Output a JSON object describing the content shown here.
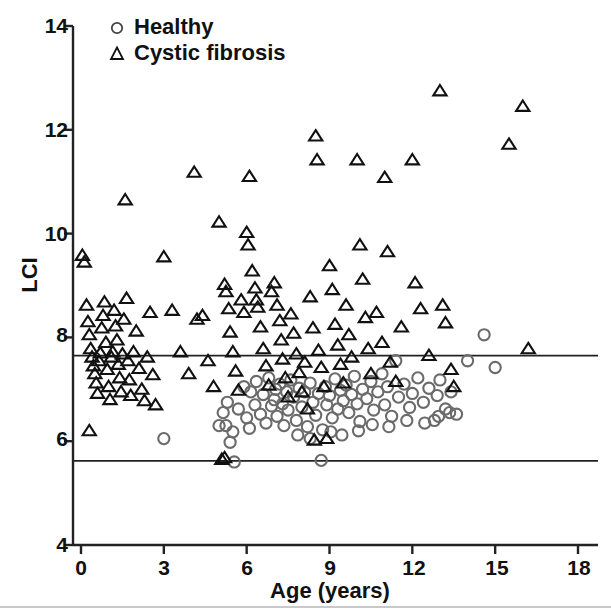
{
  "chart_data": {
    "type": "scatter",
    "title": "",
    "xlabel": "Age (years)",
    "ylabel": "LCI",
    "xlim": [
      -0.75,
      18.75
    ],
    "ylim": [
      4,
      14
    ],
    "xticks": [
      0,
      3,
      6,
      9,
      12,
      15,
      18
    ],
    "yticks": [
      4,
      6,
      8,
      10,
      12,
      14
    ],
    "grid": false,
    "legend_position": "top-left",
    "reference_lines": [
      {
        "name": "upper-limit-of-normal",
        "y": 7.65,
        "color": "#222222"
      },
      {
        "name": "lower-limit-of-normal",
        "y": 5.62,
        "color": "#222222"
      }
    ],
    "series": [
      {
        "name": "Healthy",
        "marker": "circle",
        "color": "#6b6b6b",
        "points": [
          [
            3.0,
            6.05
          ],
          [
            5.0,
            6.3
          ],
          [
            5.15,
            6.55
          ],
          [
            5.25,
            6.3
          ],
          [
            5.3,
            6.75
          ],
          [
            5.4,
            5.98
          ],
          [
            5.5,
            6.18
          ],
          [
            5.55,
            5.6
          ],
          [
            5.7,
            6.62
          ],
          [
            5.9,
            7.05
          ],
          [
            6.0,
            6.45
          ],
          [
            6.1,
            6.25
          ],
          [
            6.15,
            6.95
          ],
          [
            6.3,
            6.7
          ],
          [
            6.35,
            7.15
          ],
          [
            6.5,
            6.52
          ],
          [
            6.6,
            6.9
          ],
          [
            6.7,
            6.35
          ],
          [
            6.8,
            7.22
          ],
          [
            6.9,
            6.68
          ],
          [
            7.0,
            6.8
          ],
          [
            7.05,
            7.0
          ],
          [
            7.1,
            6.48
          ],
          [
            7.2,
            7.1
          ],
          [
            7.3,
            6.72
          ],
          [
            7.35,
            6.3
          ],
          [
            7.45,
            6.95
          ],
          [
            7.5,
            6.6
          ],
          [
            7.6,
            7.18
          ],
          [
            7.7,
            6.85
          ],
          [
            7.8,
            6.4
          ],
          [
            7.9,
            7.02
          ],
          [
            8.0,
            6.66
          ],
          [
            8.1,
            6.95
          ],
          [
            8.2,
            6.28
          ],
          [
            8.3,
            7.12
          ],
          [
            8.4,
            6.75
          ],
          [
            8.5,
            6.5
          ],
          [
            8.6,
            6.92
          ],
          [
            8.7,
            5.63
          ],
          [
            8.75,
            6.22
          ],
          [
            8.85,
            7.05
          ],
          [
            8.9,
            6.7
          ],
          [
            9.0,
            6.88
          ],
          [
            9.1,
            6.45
          ],
          [
            9.2,
            7.2
          ],
          [
            9.3,
            6.62
          ],
          [
            9.4,
            6.98
          ],
          [
            9.5,
            6.78
          ],
          [
            9.6,
            7.08
          ],
          [
            9.7,
            6.55
          ],
          [
            9.8,
            6.9
          ],
          [
            9.9,
            7.25
          ],
          [
            10.0,
            6.72
          ],
          [
            10.1,
            6.38
          ],
          [
            10.2,
            7.0
          ],
          [
            10.35,
            6.82
          ],
          [
            10.5,
            7.15
          ],
          [
            10.6,
            6.6
          ],
          [
            10.75,
            6.95
          ],
          [
            10.9,
            7.3
          ],
          [
            11.0,
            6.7
          ],
          [
            11.1,
            7.05
          ],
          [
            11.25,
            6.48
          ],
          [
            11.4,
            7.55
          ],
          [
            11.5,
            6.85
          ],
          [
            11.7,
            7.1
          ],
          [
            11.9,
            6.65
          ],
          [
            12.0,
            6.92
          ],
          [
            12.2,
            7.22
          ],
          [
            12.4,
            6.75
          ],
          [
            12.6,
            7.02
          ],
          [
            12.8,
            6.4
          ],
          [
            12.9,
            6.88
          ],
          [
            13.0,
            7.18
          ],
          [
            13.2,
            6.62
          ],
          [
            13.4,
            6.95
          ],
          [
            13.6,
            6.52
          ],
          [
            14.0,
            7.55
          ],
          [
            14.6,
            8.05
          ],
          [
            15.0,
            7.42
          ],
          [
            8.3,
            6.05
          ],
          [
            7.85,
            6.12
          ],
          [
            9.05,
            6.18
          ],
          [
            9.45,
            6.12
          ],
          [
            10.05,
            6.2
          ],
          [
            10.55,
            6.32
          ],
          [
            11.15,
            6.28
          ],
          [
            11.8,
            6.4
          ],
          [
            12.45,
            6.35
          ],
          [
            12.95,
            6.48
          ],
          [
            13.35,
            6.55
          ]
        ]
      },
      {
        "name": "Cystic fibrosis",
        "marker": "triangle",
        "color": "#111111",
        "points": [
          [
            0.05,
            9.58
          ],
          [
            0.12,
            9.45
          ],
          [
            0.2,
            8.62
          ],
          [
            0.25,
            8.3
          ],
          [
            0.3,
            8.05
          ],
          [
            0.35,
            7.78
          ],
          [
            0.4,
            7.62
          ],
          [
            0.45,
            7.45
          ],
          [
            0.5,
            7.3
          ],
          [
            0.55,
            7.12
          ],
          [
            0.6,
            6.92
          ],
          [
            0.65,
            7.55
          ],
          [
            0.7,
            7.7
          ],
          [
            0.75,
            8.18
          ],
          [
            0.8,
            8.42
          ],
          [
            0.85,
            8.68
          ],
          [
            0.9,
            7.9
          ],
          [
            0.95,
            7.38
          ],
          [
            1.0,
            7.05
          ],
          [
            1.05,
            6.8
          ],
          [
            1.1,
            7.62
          ],
          [
            1.15,
            7.72
          ],
          [
            1.2,
            8.52
          ],
          [
            1.25,
            8.22
          ],
          [
            1.3,
            7.95
          ],
          [
            1.35,
            7.48
          ],
          [
            1.4,
            7.22
          ],
          [
            1.45,
            6.95
          ],
          [
            1.5,
            7.68
          ],
          [
            1.55,
            8.35
          ],
          [
            1.6,
            10.65
          ],
          [
            1.65,
            8.75
          ],
          [
            1.7,
            7.55
          ],
          [
            1.75,
            7.18
          ],
          [
            1.8,
            6.88
          ],
          [
            1.9,
            7.72
          ],
          [
            2.0,
            8.12
          ],
          [
            2.1,
            7.4
          ],
          [
            2.2,
            7.0
          ],
          [
            2.3,
            6.78
          ],
          [
            2.4,
            7.62
          ],
          [
            2.5,
            8.48
          ],
          [
            2.6,
            7.28
          ],
          [
            2.7,
            6.7
          ],
          [
            0.3,
            6.2
          ],
          [
            3.0,
            9.55
          ],
          [
            3.3,
            8.52
          ],
          [
            3.6,
            7.72
          ],
          [
            3.9,
            7.3
          ],
          [
            4.1,
            11.18
          ],
          [
            4.2,
            8.35
          ],
          [
            4.4,
            8.42
          ],
          [
            4.6,
            7.55
          ],
          [
            4.8,
            7.05
          ],
          [
            5.0,
            10.22
          ],
          [
            5.2,
            9.02
          ],
          [
            5.25,
            8.88
          ],
          [
            5.35,
            8.55
          ],
          [
            5.4,
            8.1
          ],
          [
            5.5,
            7.72
          ],
          [
            5.6,
            7.35
          ],
          [
            5.7,
            6.98
          ],
          [
            5.8,
            8.72
          ],
          [
            5.9,
            8.48
          ],
          [
            6.0,
            10.02
          ],
          [
            6.05,
            9.78
          ],
          [
            6.1,
            11.1
          ],
          [
            6.2,
            9.28
          ],
          [
            6.3,
            8.95
          ],
          [
            6.35,
            8.72
          ],
          [
            6.4,
            8.58
          ],
          [
            6.5,
            8.2
          ],
          [
            6.6,
            7.78
          ],
          [
            6.7,
            7.45
          ],
          [
            6.8,
            7.08
          ],
          [
            6.9,
            8.88
          ],
          [
            7.0,
            9.05
          ],
          [
            7.1,
            8.62
          ],
          [
            7.2,
            8.32
          ],
          [
            7.25,
            7.95
          ],
          [
            7.3,
            7.58
          ],
          [
            7.4,
            7.22
          ],
          [
            7.5,
            6.85
          ],
          [
            7.6,
            8.45
          ],
          [
            7.7,
            8.08
          ],
          [
            7.8,
            7.68
          ],
          [
            7.9,
            7.32
          ],
          [
            8.0,
            6.95
          ],
          [
            8.1,
            7.52
          ],
          [
            8.2,
            6.62
          ],
          [
            8.3,
            8.78
          ],
          [
            8.4,
            8.18
          ],
          [
            8.5,
            11.88
          ],
          [
            8.55,
            11.42
          ],
          [
            8.6,
            7.75
          ],
          [
            8.7,
            7.42
          ],
          [
            8.8,
            7.05
          ],
          [
            8.9,
            6.05
          ],
          [
            9.0,
            9.38
          ],
          [
            9.1,
            8.92
          ],
          [
            9.2,
            8.25
          ],
          [
            9.3,
            7.85
          ],
          [
            9.4,
            7.48
          ],
          [
            9.5,
            7.12
          ],
          [
            9.6,
            8.62
          ],
          [
            9.7,
            8.05
          ],
          [
            9.8,
            7.62
          ],
          [
            10.0,
            11.42
          ],
          [
            10.1,
            9.78
          ],
          [
            10.2,
            9.12
          ],
          [
            10.3,
            8.38
          ],
          [
            10.4,
            7.78
          ],
          [
            10.5,
            7.3
          ],
          [
            10.7,
            8.48
          ],
          [
            10.9,
            7.9
          ],
          [
            11.0,
            11.08
          ],
          [
            11.1,
            9.65
          ],
          [
            11.2,
            7.52
          ],
          [
            11.4,
            7.15
          ],
          [
            11.6,
            8.2
          ],
          [
            12.0,
            11.42
          ],
          [
            12.1,
            9.05
          ],
          [
            12.3,
            8.55
          ],
          [
            12.6,
            7.65
          ],
          [
            13.0,
            12.75
          ],
          [
            13.1,
            8.62
          ],
          [
            13.2,
            8.28
          ],
          [
            13.4,
            7.38
          ],
          [
            13.5,
            7.05
          ],
          [
            16.0,
            12.45
          ],
          [
            15.5,
            11.72
          ],
          [
            16.2,
            7.78
          ],
          [
            5.1,
            5.65
          ],
          [
            5.2,
            5.68
          ],
          [
            8.45,
            6.02
          ]
        ]
      }
    ]
  },
  "axes": {
    "y_tick_labels": [
      "14",
      "12",
      "10",
      "8",
      "6",
      "4"
    ],
    "x_tick_labels": [
      "0",
      "3",
      "6",
      "9",
      "12",
      "15",
      "18"
    ],
    "y_axis_title": "LCI",
    "x_axis_title": "Age (years)"
  },
  "legend": {
    "items": [
      {
        "label": "Healthy",
        "marker": "circle-icon"
      },
      {
        "label": "Cystic fibrosis",
        "marker": "triangle-icon"
      }
    ]
  },
  "colors": {
    "healthy_marker": "#6b6b6b",
    "cf_marker": "#111111",
    "axis": "#222222",
    "background": "#ffffff"
  }
}
